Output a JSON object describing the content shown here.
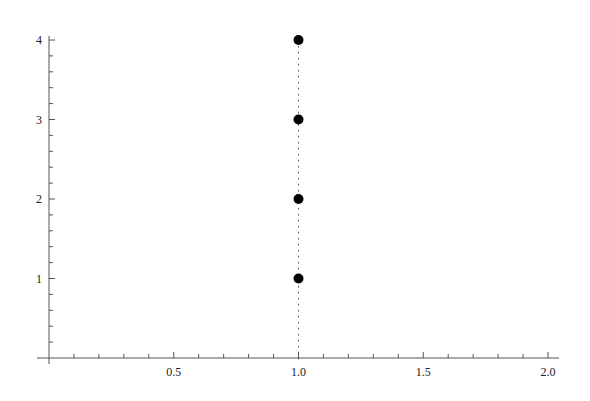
{
  "chart_data": {
    "type": "scatter",
    "title": "",
    "xlabel": "",
    "ylabel": "",
    "xlim": [
      0,
      2.0
    ],
    "ylim": [
      0,
      4
    ],
    "grid": false,
    "legend": null,
    "x_ticks": [
      {
        "value": 0.5,
        "label": "0.5"
      },
      {
        "value": 1.0,
        "label": "1.0"
      },
      {
        "value": 1.5,
        "label": "1.5"
      },
      {
        "value": 2.0,
        "label": "2.0"
      }
    ],
    "y_ticks": [
      {
        "value": 1,
        "label": "1"
      },
      {
        "value": 2,
        "label": "2"
      },
      {
        "value": 3,
        "label": "3"
      },
      {
        "value": 4,
        "label": "4"
      }
    ],
    "series": [
      {
        "name": "points",
        "points": [
          {
            "x": 1.0,
            "y": 1
          },
          {
            "x": 1.0,
            "y": 2
          },
          {
            "x": 1.0,
            "y": 3
          },
          {
            "x": 1.0,
            "y": 4
          }
        ],
        "marker_color": "#000000"
      }
    ],
    "annotations": [
      {
        "type": "vertical-dotted-line",
        "x": 1.0,
        "from_y": 0,
        "to_y": 4,
        "color": "#555555"
      }
    ]
  },
  "colors": {
    "axis": "#555555",
    "marker": "#000000",
    "background": "#ffffff"
  }
}
